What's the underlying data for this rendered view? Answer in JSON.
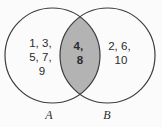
{
  "diagram": {
    "type": "venn",
    "colors": {
      "background": "#fbfbfb",
      "circle_fill": "#fdfdfd",
      "circle_stroke": "#3c3c3c",
      "intersection_fill": "#b3b3b3",
      "text": "#2b2b2b"
    },
    "set_a": {
      "label": "A",
      "only_lines": [
        "1, 3,",
        "5, 7,",
        "9"
      ],
      "only_values": [
        1,
        3,
        5,
        7,
        9
      ]
    },
    "set_b": {
      "label": "B",
      "only_lines": [
        "2, 6,",
        "10"
      ],
      "only_values": [
        2,
        6,
        10
      ]
    },
    "intersection": {
      "lines": [
        "4,",
        "8"
      ],
      "values": [
        4,
        8
      ]
    }
  }
}
